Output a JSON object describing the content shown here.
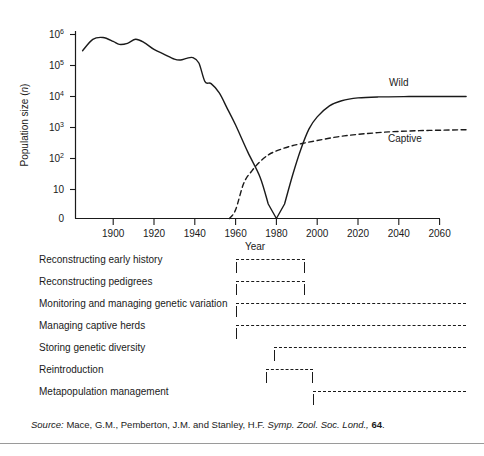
{
  "chart_data": {
    "type": "line",
    "title": "",
    "xlabel": "Year",
    "ylabel": "Population size (n)",
    "yscale": "log",
    "ylim": [
      0,
      1000000
    ],
    "xlim": [
      1885,
      2073
    ],
    "grid": false,
    "legend_position": "inline-right",
    "y_tick_labels": [
      "10^6",
      "10^5",
      "10^4",
      "10^3",
      "10^2",
      "10",
      "0"
    ],
    "y_tick_values": [
      1000000,
      100000,
      10000,
      1000,
      100,
      10,
      0
    ],
    "x_tick_labels": [
      "1900",
      "1920",
      "1940",
      "1960",
      "1980",
      "2000",
      "2020",
      "2040",
      "2060"
    ],
    "x_tick_values": [
      1900,
      1920,
      1940,
      1960,
      1980,
      2000,
      2020,
      2040,
      2060
    ],
    "series": [
      {
        "name": "Wild",
        "style": "solid",
        "x": [
          1885,
          1890,
          1895,
          1900,
          1903,
          1907,
          1911,
          1915,
          1920,
          1925,
          1930,
          1933,
          1936,
          1939,
          1942,
          1945,
          1948,
          1952,
          1956,
          1960,
          1966,
          1972,
          1976,
          1980,
          1984,
          1988,
          1992,
          1996,
          2000,
          2006,
          2012,
          2020,
          2030,
          2045,
          2060,
          2073
        ],
        "y": [
          300000,
          700000,
          800000,
          600000,
          480000,
          520000,
          700000,
          560000,
          330000,
          230000,
          160000,
          150000,
          170000,
          180000,
          120000,
          30000,
          26000,
          13000,
          4000,
          1200,
          160,
          25,
          5,
          0,
          5,
          30,
          200,
          900,
          2200,
          5000,
          7300,
          9000,
          9700,
          9950,
          10000,
          10000
        ]
      },
      {
        "name": "Captive",
        "style": "dashed",
        "x": [
          1957,
          1960,
          1964,
          1968,
          1972,
          1976,
          1980,
          1986,
          1992,
          2000,
          2010,
          2020,
          2035,
          2050,
          2065,
          2073
        ],
        "y": [
          0,
          3,
          16,
          40,
          80,
          130,
          175,
          240,
          300,
          380,
          500,
          600,
          720,
          790,
          830,
          850
        ]
      }
    ],
    "annotations": [
      {
        "text": "Wild",
        "x": 2040,
        "y": 22000
      },
      {
        "text": "Captive",
        "x": 2043,
        "y": 330
      }
    ]
  },
  "timeline": {
    "rows": [
      {
        "label": "Reconstructing early history",
        "start_year": 1960,
        "end_year": 1994
      },
      {
        "label": "Reconstructing pedigrees",
        "start_year": 1960,
        "end_year": 1994
      },
      {
        "label": "Monitoring and managing genetic variation",
        "start_year": 1960,
        "end_year": 2073
      },
      {
        "label": "Managing captive herds",
        "start_year": 1960,
        "end_year": 2073
      },
      {
        "label": "Storing genetic diversity",
        "start_year": 1979,
        "end_year": 2073
      },
      {
        "label": "Reintroduction",
        "start_year": 1975,
        "end_year": 1998
      },
      {
        "label": "Metapopulation management",
        "start_year": 1998,
        "end_year": 2073
      }
    ]
  },
  "source": {
    "prefix": "Source:",
    "authors": "Mace, G.M., Pemberton, J.M. and Stanley, H.F.",
    "journal": "Symp. Zool. Soc. Lond.,",
    "volume": "64",
    "terminator": "."
  }
}
